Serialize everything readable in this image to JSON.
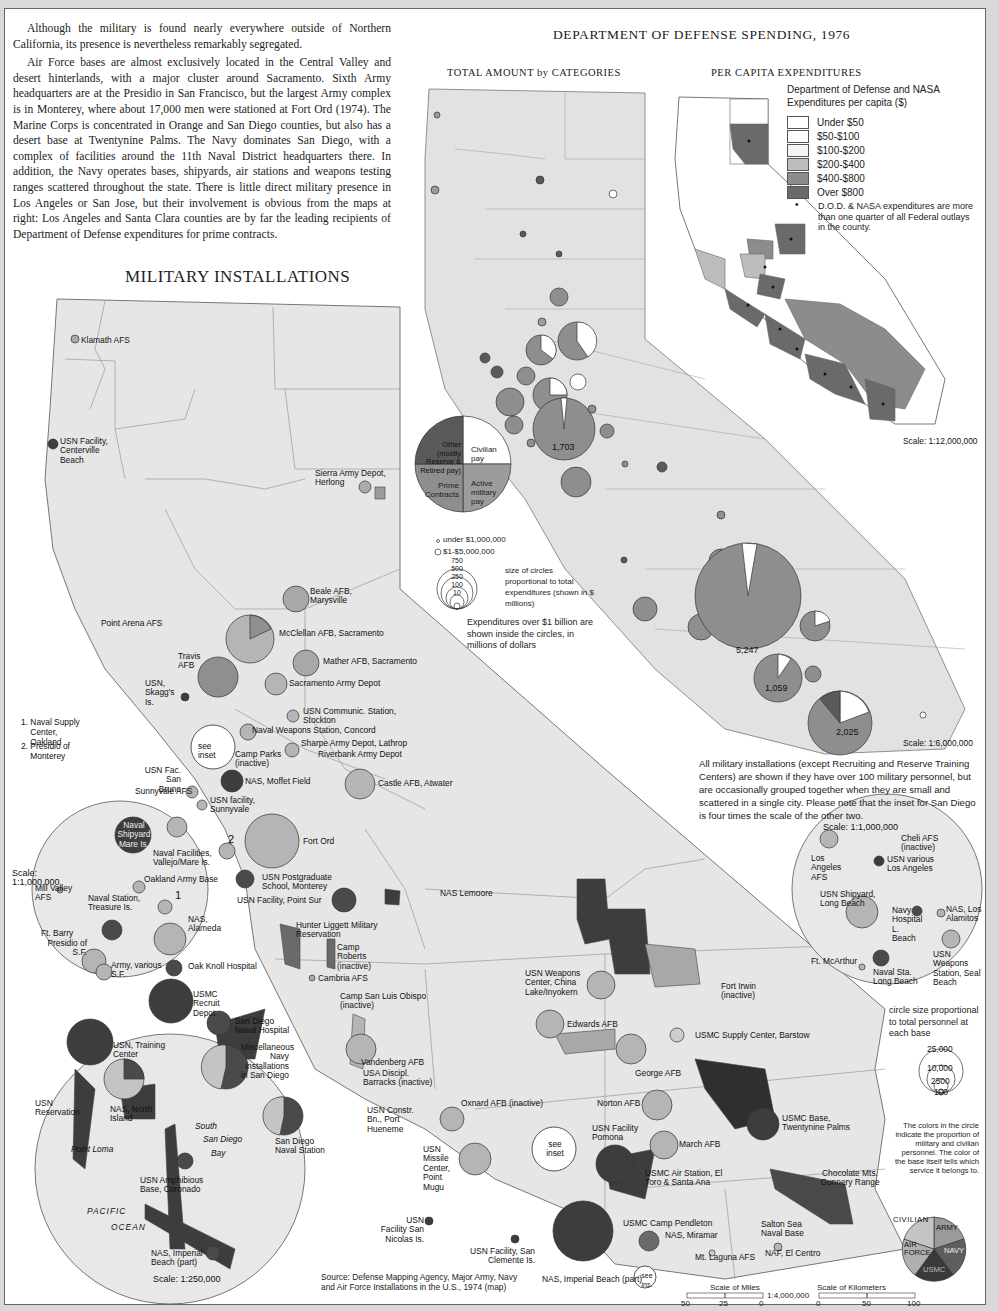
{
  "intro": {
    "paragraphs": [
      "Although the military is found nearly everywhere outside of Northern California, its presence is nevertheless remarkably segregated.",
      "Air Force bases are almost exclusively located in the Central Valley and desert hinterlands, with a major cluster around Sacramento.  Sixth Army headquarters are at the Presidio in San Francisco, but the largest Army complex is in Monterey, where about 17,000 men were stationed at Fort Ord (1974). The Marine Corps is concentrated in Orange and San Diego counties, but also has a desert base at Twentynine Palms. The Navy dominates San Diego, with a complex of facilities around the 11th Naval District headquarters there. In addition, the Navy operates bases, shipyards, air stations and weapons testing ranges scattered throughout the state. There is little direct military presence in Los Angeles or San Jose, but their involvement is obvious from the maps at right: Los Angeles and Santa Clara counties are by far the leading recipients of Department of Defense expenditures for prime contracts."
    ]
  },
  "military_map": {
    "title": "MILITARY INSTALLATIONS",
    "numbered_notes": [
      {
        "num": "1.",
        "text": "Naval Supply Center, Oakland"
      },
      {
        "num": "2.",
        "text": "Presidio of Monterey"
      }
    ],
    "labels": {
      "klamath": "Klamath AFS",
      "centerville": "USN Facility, Centerville Beach",
      "sierra": "Sierra Army Depot, Herlong",
      "beale": "Beale AFB, Marysville",
      "point_arena": "Point Arena AFS",
      "mcclellan": "McClellan AFB, Sacramento",
      "travis": "Travis AFB",
      "mather": "Mather AFB, Sacramento",
      "skaggs": "USN, Skagg's Is.",
      "sac_army": "Sacramento Army Depot",
      "stockton": "USN Communic. Station, Stockton",
      "concord": "Naval Weapons Station, Concord",
      "see_inset": "see inset",
      "camp_parks": "Camp Parks (inactive)",
      "sharpe": "Sharpe Army Depot, Lathrop",
      "riverbank": "Riverbank Army Depot",
      "san_bruno": "USN Fac. San Bruno",
      "sunnyvale_afs": "Sunnyvale AFS",
      "moffett": "NAS, Moffet Field",
      "usn_sunnyvale": "USN facility, Sunnyvale",
      "castle": "Castle AFB, Atwater",
      "fort_ord": "Fort Ord",
      "num2": "2",
      "postgrad": "USN Postgraduate School, Monterey",
      "point_sur": "USN Facility, Point Sur",
      "nas_lemoore": "NAS Lemoore",
      "hunter": "Hunter Liggett Military Reservation",
      "camp_roberts": "Camp Roberts (inactive)",
      "cambria": "Cambria AFS",
      "slo": "Camp San Luis Obispo (inactive)",
      "china_lake": "USN Weapons Center, China Lake/Inyokern",
      "fort_irwin": "Fort Irwin (inactive)",
      "edwards": "Edwards AFB",
      "barstow": "USMC Supply Center, Barstow",
      "vandenberg": "Vandenberg AFB",
      "usa_disc": "USA Discipl. Barracks (inactive)",
      "george": "George AFB",
      "oxnard": "Oxnard AFB (inactive)",
      "hueneme": "USN Constr. Bn., Port Hueneme",
      "norton": "Norton AFB",
      "twentynine": "USMC Base, Twentynine Palms",
      "pomona": "USN Facility Pomona",
      "mugu": "USN Missile Center, Point Mugu",
      "march": "March AFB",
      "see_inset2": "see inset",
      "el_toro": "USMC Air Station, El Toro & Santa Ana",
      "chocolate": "Chocolate Mts. Gunnery Range",
      "san_nicolas": "USN Facility San Nicolas Is.",
      "san_clemente": "USN Facility, San Clemente Is.",
      "pendleton": "USMC Camp Pendleton",
      "miramar": "NAS, Miramar",
      "salton": "Salton Sea Naval Base",
      "laguna": "Mt. Laguna AFS",
      "el_centro": "NAF, El Centro",
      "imperial_part": "NAS, Imperial Beach (part)",
      "see_ins": "see ins."
    },
    "sf_inset": {
      "scale": "Scale: 1:1,000,000",
      "labels": [
        "Naval Shipyard Mare Is.",
        "Naval Facilities, Vallejo/Mare Is.",
        "Mill Valley AFS",
        "Oakland Army Base",
        "Naval Station, Treasure Is.",
        "1",
        "NAS, Alameda",
        "Ft. Barry",
        "Presidio of S.F.",
        "Army, various S.F.",
        "Oak Knoll Hospital"
      ]
    },
    "sd_inset": {
      "scale": "Scale: 1:250,000",
      "labels": [
        "USMC Recruit Depot",
        "San Diego Naval Hospital",
        "USN, Training Center",
        "Miscellaneous Navy installations in San Diego",
        "USN Reservation",
        "NAS, North Island",
        "South",
        "San Diego",
        "Bay",
        "San Diego Naval Station",
        "Point Loma",
        "USN Amphibious Base, Coronado",
        "PACIFIC",
        "OCEAN",
        "NAS, Imperial Beach (part)"
      ]
    },
    "la_inset": {
      "scale": "Scale: 1:1,000,000",
      "labels": [
        "Cheli AFS (inactive)",
        "Los Angeles AFS",
        "USN various Los Angeles",
        "USN Shipyard, Long Beach",
        "Navy Hospital L. Beach",
        "NAS, Los Alamitos",
        "Ft. McArthur",
        "Naval Sta. Long Beach",
        "USN Weapons Station, Seal Beach"
      ]
    },
    "notes": {
      "inclusion": "All military installations (except Recruiting and Reserve Training Centers) are shown if they have over 100 military personnel, but are occasionally grouped together when they are small and scattered in a single city. Please note that the inset for San Diego is four times the scale of the other two.",
      "circle_size": "circle size proportional to total personnel at each base",
      "circle_values": [
        "25,000",
        "10,000",
        "2500",
        "100"
      ],
      "colors_note": "The colors in the circle indicate the proportion of military and civilian personnel. The color of the base itself tells which service it belongs to."
    },
    "service_legend": {
      "civilian": "CIVILIAN",
      "army": "ARMY",
      "air_force": "AIR FORCE",
      "navy": "NAVY",
      "usmc": "USMC",
      "colors": {
        "civilian": "#c4c4c4",
        "army": "#9a9a9a",
        "air_force": "#b0b0b0",
        "navy": "#5e5e5e",
        "usmc": "#3a3a3a"
      }
    },
    "scale_bar": {
      "miles_label": "Scale of Miles",
      "km_label": "Scale of Kilometers",
      "ratio": "1:4,000,000",
      "miles_ticks": [
        "50",
        "25",
        "0"
      ],
      "km_ticks": [
        "0",
        "50",
        "100"
      ]
    },
    "source": "Source: Defense Mapping Agency, Major Army, Navy and Air Force Installations in the U.S., 1974 (map)"
  },
  "spending_map": {
    "title": "DEPARTMENT OF DEFENSE SPENDING, 1976",
    "subtitle": "TOTAL AMOUNT by CATEGORIES",
    "category_legend": {
      "other": "Other (mostly Reserve & Retired pay)",
      "civilian": "Civilian pay",
      "prime": "Prime Contracts",
      "active": "Active military pay",
      "colors": {
        "other": "#5a5a5a",
        "civilian": "#ffffff",
        "prime": "#8e8e8e",
        "active": "#9c9c9c"
      }
    },
    "size_legend": {
      "small1": "under $1,000,000",
      "small2": "$1-$5,000,000",
      "values": [
        "750",
        "500",
        "250",
        "100",
        "10"
      ],
      "note": "size of circles proportional to total expenditures (shown in $ millions)",
      "billion_note": "Expenditures over $1 billion are shown inside the circles, in millions of dollars"
    },
    "big_values": {
      "santa_clara": "1,703",
      "los_angeles": "5,247",
      "orange": "1,059",
      "san_diego": "2,025"
    },
    "scale": "Scale: 1:6,000,000"
  },
  "per_capita_map": {
    "subtitle": "PER CAPITA EXPENDITURES",
    "legend_title": "Department of Defense and NASA Expenditures per capita ($)",
    "bins": [
      {
        "label": "Under $50",
        "color": "#ffffff"
      },
      {
        "label": "$50-$100",
        "color": "#fbfbfb"
      },
      {
        "label": "$100-$200",
        "color": "#f4f4f4"
      },
      {
        "label": "$200-$400",
        "color": "#bdbdbd"
      },
      {
        "label": "$400-$800",
        "color": "#8c8c8c"
      },
      {
        "label": "Over $800",
        "color": "#6a6a6a"
      }
    ],
    "dot_note": "D.O.D. & NASA expenditures are more than one quarter of all Federal outlays in the county.",
    "scale": "Scale: 1:12,000,000"
  }
}
